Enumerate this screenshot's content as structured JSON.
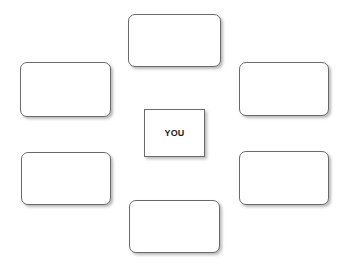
{
  "diagram": {
    "center": {
      "label": "YOU"
    },
    "nodes": [
      {
        "position": "top",
        "label": ""
      },
      {
        "position": "upper-left",
        "label": ""
      },
      {
        "position": "upper-right",
        "label": ""
      },
      {
        "position": "lower-left",
        "label": ""
      },
      {
        "position": "lower-right",
        "label": ""
      },
      {
        "position": "bottom",
        "label": ""
      }
    ],
    "colors": {
      "border": "#6a6a6a",
      "fill": "#ffffff"
    }
  }
}
